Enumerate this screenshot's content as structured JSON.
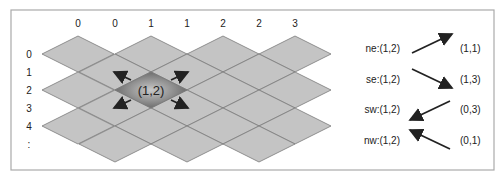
{
  "column_labels": [
    "0",
    "0",
    "1",
    "1",
    "2",
    "2",
    "3"
  ],
  "row_labels": [
    "0",
    "1",
    "2",
    "3",
    "4",
    ":"
  ],
  "center_cell": {
    "label": "(1,2)"
  },
  "neighbors": [
    {
      "dir_label": "ne:(1,2)",
      "result": "(1,1)"
    },
    {
      "dir_label": "se:(1,2)",
      "result": "(1,3)"
    },
    {
      "dir_label": "sw:(1,2)",
      "result": "(0,3)"
    },
    {
      "dir_label": "nw:(1,2)",
      "result": "(0,1)"
    }
  ],
  "colors": {
    "tile": "#c4c4c4",
    "tile_stroke": "#7a7a7a",
    "highlight_dark": "#6e6e6e",
    "highlight_light": "#b8b8b8",
    "arrow": "#222222",
    "border": "#aaaaaa"
  }
}
